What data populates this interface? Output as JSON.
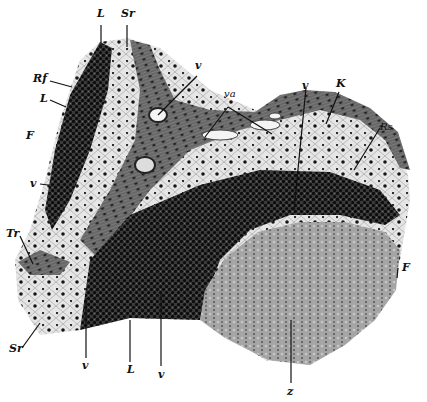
{
  "figure": {
    "colors": {
      "background": "#ffffff",
      "connective_tissue": "#6e6e6e",
      "reticular_tissue": "#d8d8d8",
      "lymphoid_dense": "#1c1c1c",
      "z_region": "#9a9a9a",
      "nuclei": "#111111"
    },
    "labels": [
      {
        "id": "L-top",
        "text": "L",
        "x": 97,
        "y": 12
      },
      {
        "id": "Sr-top",
        "text": "Sr",
        "x": 122,
        "y": 12
      },
      {
        "id": "Rf",
        "text": "Rf",
        "x": 34,
        "y": 76
      },
      {
        "id": "L-left",
        "text": "L",
        "x": 40,
        "y": 95
      },
      {
        "id": "F-left",
        "text": "F",
        "x": 27,
        "y": 132
      },
      {
        "id": "v-upper",
        "text": "v",
        "x": 195,
        "y": 62
      },
      {
        "id": "va",
        "text": "va",
        "x": 226,
        "y": 91
      },
      {
        "id": "v-mid",
        "text": "v",
        "x": 302,
        "y": 82
      },
      {
        "id": "K",
        "text": "K",
        "x": 338,
        "y": 80
      },
      {
        "id": "Rs",
        "text": "Rs",
        "x": 381,
        "y": 124
      },
      {
        "id": "v-left",
        "text": "v",
        "x": 30,
        "y": 180
      },
      {
        "id": "Tr",
        "text": "Tr",
        "x": 7,
        "y": 230
      },
      {
        "id": "F-right",
        "text": "F",
        "x": 404,
        "y": 265
      },
      {
        "id": "Sr-bottom",
        "text": "Sr",
        "x": 10,
        "y": 343
      },
      {
        "id": "v-bottom-1",
        "text": "v",
        "x": 83,
        "y": 361
      },
      {
        "id": "L-bottom",
        "text": "L",
        "x": 128,
        "y": 365
      },
      {
        "id": "v-bottom-2",
        "text": "v",
        "x": 160,
        "y": 369
      },
      {
        "id": "z",
        "text": "z",
        "x": 288,
        "y": 387
      }
    ]
  }
}
